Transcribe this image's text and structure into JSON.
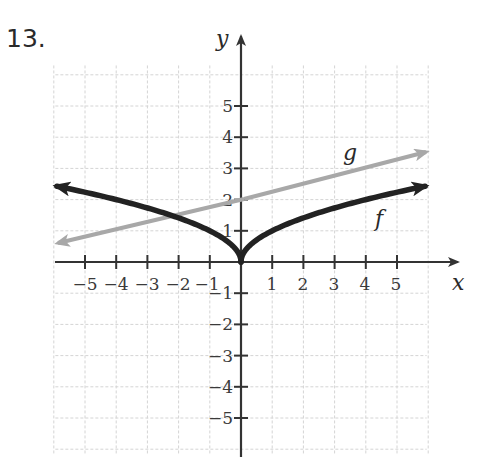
{
  "problem": {
    "number": "13."
  },
  "axes": {
    "x_label": "x",
    "y_label": "y",
    "x_ticks": [
      "−5",
      "−4",
      "−3",
      "−2",
      "−1",
      "1",
      "2",
      "3",
      "4",
      "5"
    ],
    "y_ticks_positive": [
      "1",
      "2",
      "3",
      "4",
      "5"
    ],
    "y_ticks_negative": [
      "−1",
      "−2",
      "−3",
      "−4",
      "−5"
    ]
  },
  "functions": {
    "f": {
      "label": "f",
      "color": "#222222"
    },
    "g": {
      "label": "g",
      "color": "#a8a8a8"
    }
  },
  "colors": {
    "grid": "#d4d4d4",
    "axis": "#333333",
    "background": "#ffffff"
  },
  "chart_data": {
    "type": "line",
    "title": "13.",
    "xlabel": "x",
    "ylabel": "y",
    "xlim": [
      -6,
      6
    ],
    "ylim": [
      -6,
      6
    ],
    "grid": true,
    "x_ticks": [
      -5,
      -4,
      -3,
      -2,
      -1,
      1,
      2,
      3,
      4,
      5
    ],
    "y_ticks": [
      -5,
      -4,
      -3,
      -2,
      -1,
      1,
      2,
      3,
      4,
      5
    ],
    "series": [
      {
        "name": "f",
        "description": "V-shaped radical-type curve with cusp at origin, arrows at both ends",
        "x": [
          -6,
          -5,
          -4,
          -3,
          -2,
          -1,
          -0.5,
          0,
          0.5,
          1,
          2,
          3,
          4,
          5,
          6
        ],
        "y": [
          2.45,
          2.24,
          2.0,
          1.73,
          1.41,
          1.0,
          0.71,
          0,
          0.71,
          1.0,
          1.41,
          1.73,
          2.0,
          2.24,
          2.45
        ]
      },
      {
        "name": "g",
        "description": "Straight line with y-intercept 2, arrows at both ends",
        "x": [
          -6,
          -4,
          -2,
          0,
          2,
          4,
          6
        ],
        "y": [
          0.6,
          1.07,
          1.53,
          2.0,
          2.47,
          2.93,
          3.4
        ]
      }
    ]
  }
}
